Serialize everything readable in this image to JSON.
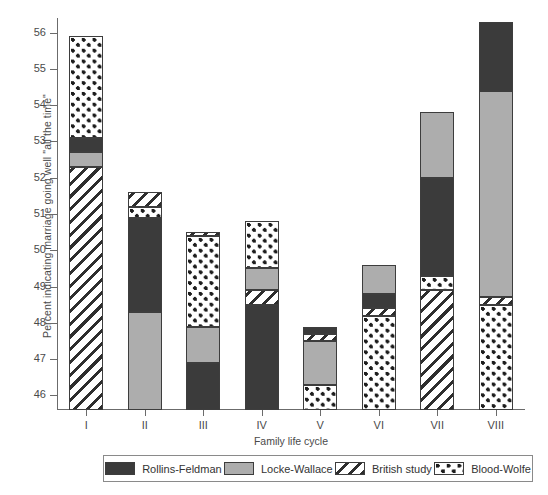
{
  "chart_data": {
    "type": "bar",
    "subtype": "stacked-bar",
    "title": "",
    "xlabel": "Family life cycle",
    "ylabel": "Percent indicating marriage going well \"all the time\"",
    "categories": [
      "I",
      "II",
      "III",
      "IV",
      "V",
      "VI",
      "VII",
      "VIII"
    ],
    "ylim": [
      45.6,
      56.4
    ],
    "ytick_labels": [
      "46",
      "47",
      "48",
      "49",
      "50",
      "51",
      "52",
      "53",
      "54",
      "55",
      "56"
    ],
    "yticks": [
      46,
      47,
      48,
      49,
      50,
      51,
      52,
      53,
      54,
      55,
      56
    ],
    "grid": false,
    "legend_position": "bottom",
    "stack_baseline": 45.6,
    "series": [
      {
        "name": "Rollins-Feldman",
        "pattern": "solid-dark",
        "color": "#3b3b3b",
        "values": [
          0.3,
          2.6,
          1.3,
          2.9,
          0.2,
          0.4,
          2.7,
          1.9
        ]
      },
      {
        "name": "Locke-Wallace",
        "pattern": "solid-gray",
        "color": "#adadad",
        "values": [
          0.4,
          2.7,
          1.0,
          0.6,
          1.2,
          0.9,
          1.8,
          4.4
        ]
      },
      {
        "name": "British study",
        "pattern": "diagonal-hatch",
        "color": "#ffffff",
        "values": [
          6.7,
          0.3,
          0.1,
          0.4,
          0.2,
          0.3,
          3.3,
          0.2
        ]
      },
      {
        "name": "Blood-Wolfe",
        "pattern": "checker-dots",
        "color": "#ffffff",
        "values": [
          2.7,
          0.3,
          2.1,
          0.9,
          0.8,
          2.4,
          0.4,
          2.9
        ]
      }
    ],
    "bars": [
      {
        "category": "I",
        "top_value": 55.9,
        "segments": [
          {
            "series": "British study",
            "from": 45.6,
            "to": 52.3
          },
          {
            "series": "Locke-Wallace",
            "from": 52.3,
            "to": 52.7
          },
          {
            "series": "Rollins-Feldman",
            "from": 52.7,
            "to": 53.1
          },
          {
            "series": "Blood-Wolfe",
            "from": 53.1,
            "to": 55.9
          }
        ]
      },
      {
        "category": "II",
        "top_value": 51.6,
        "segments": [
          {
            "series": "Locke-Wallace",
            "from": 45.6,
            "to": 48.3
          },
          {
            "series": "Rollins-Feldman",
            "from": 48.3,
            "to": 50.9
          },
          {
            "series": "Blood-Wolfe",
            "from": 50.9,
            "to": 51.2
          },
          {
            "series": "British study",
            "from": 51.2,
            "to": 51.6
          }
        ]
      },
      {
        "category": "III",
        "top_value": 50.5,
        "segments": [
          {
            "series": "Rollins-Feldman",
            "from": 45.6,
            "to": 46.9
          },
          {
            "series": "Locke-Wallace",
            "from": 46.9,
            "to": 47.9
          },
          {
            "series": "Blood-Wolfe",
            "from": 47.9,
            "to": 50.4
          },
          {
            "series": "British study",
            "from": 50.4,
            "to": 50.5
          }
        ]
      },
      {
        "category": "IV",
        "top_value": 50.8,
        "segments": [
          {
            "series": "Rollins-Feldman",
            "from": 45.6,
            "to": 48.5
          },
          {
            "series": "British study",
            "from": 48.5,
            "to": 48.9
          },
          {
            "series": "Locke-Wallace",
            "from": 48.9,
            "to": 49.5
          },
          {
            "series": "Blood-Wolfe",
            "from": 49.5,
            "to": 50.8
          }
        ]
      },
      {
        "category": "V",
        "top_value": 47.9,
        "segments": [
          {
            "series": "Blood-Wolfe",
            "from": 45.6,
            "to": 46.3
          },
          {
            "series": "Locke-Wallace",
            "from": 46.3,
            "to": 47.5
          },
          {
            "series": "British study",
            "from": 47.5,
            "to": 47.7
          },
          {
            "series": "Rollins-Feldman",
            "from": 47.7,
            "to": 47.9
          }
        ]
      },
      {
        "category": "VI",
        "top_value": 49.6,
        "segments": [
          {
            "series": "Blood-Wolfe",
            "from": 45.6,
            "to": 48.2
          },
          {
            "series": "British study",
            "from": 48.2,
            "to": 48.4
          },
          {
            "series": "Rollins-Feldman",
            "from": 48.4,
            "to": 48.8
          },
          {
            "series": "Locke-Wallace",
            "from": 48.8,
            "to": 49.6
          }
        ]
      },
      {
        "category": "VII",
        "top_value": 53.8,
        "segments": [
          {
            "series": "British study",
            "from": 45.6,
            "to": 48.9
          },
          {
            "series": "Blood-Wolfe",
            "from": 48.9,
            "to": 49.3
          },
          {
            "series": "Rollins-Feldman",
            "from": 49.3,
            "to": 52.0
          },
          {
            "series": "Locke-Wallace",
            "from": 52.0,
            "to": 53.8
          }
        ]
      },
      {
        "category": "VIII",
        "top_value": 56.3,
        "segments": [
          {
            "series": "Blood-Wolfe",
            "from": 45.6,
            "to": 48.5
          },
          {
            "series": "British study",
            "from": 48.5,
            "to": 48.7
          },
          {
            "series": "Locke-Wallace",
            "from": 48.7,
            "to": 54.4
          },
          {
            "series": "Rollins-Feldman",
            "from": 54.4,
            "to": 56.3
          }
        ]
      }
    ]
  },
  "legend": {
    "items": [
      {
        "label": "Rollins-Feldman",
        "key": "rollins"
      },
      {
        "label": "Locke-Wallace",
        "key": "locke"
      },
      {
        "label": "British study",
        "key": "british"
      },
      {
        "label": "Blood-Wolfe",
        "key": "blood"
      }
    ]
  }
}
